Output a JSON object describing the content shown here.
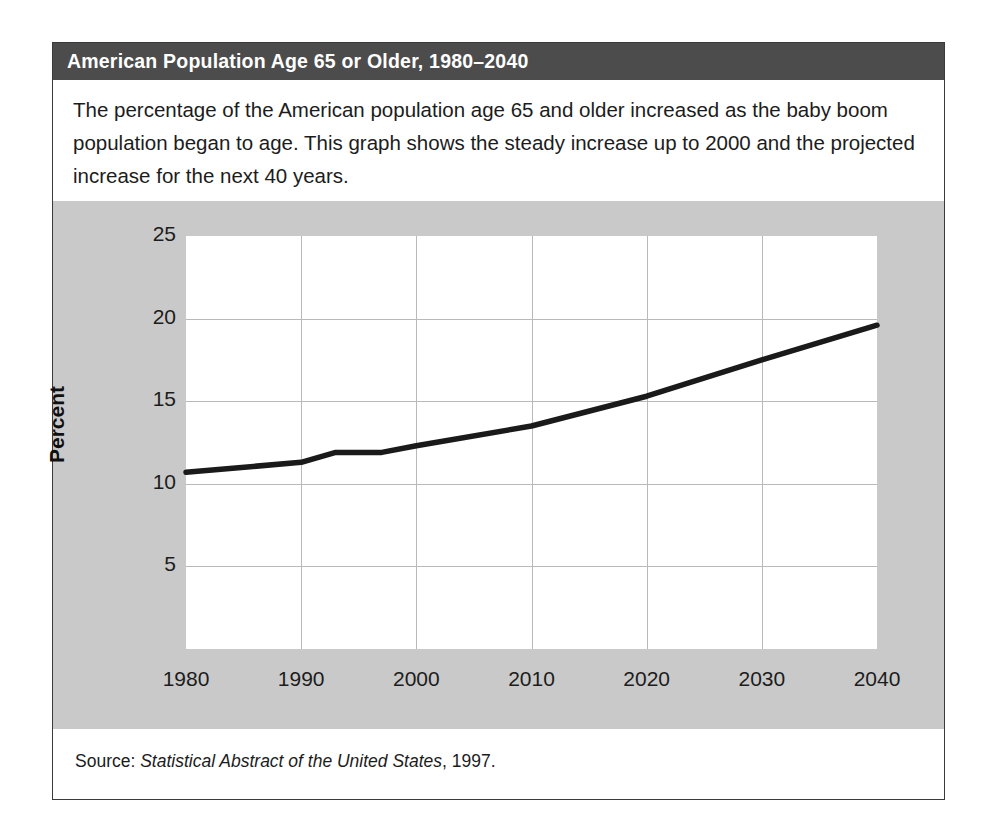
{
  "figure": {
    "title": "American Population Age 65 or Older, 1980–2040",
    "description": "The percentage of the American population age 65 and older increased as the baby boom population began to age. This graph shows the steady increase up to 2000 and the projected increase for the next 40 years.",
    "source_prefix": "Source: ",
    "source_title": "Statistical Abstract of the United States",
    "source_suffix": ", 1997.",
    "colors": {
      "title_bar": "#4c4c4c",
      "title_text": "#ffffff",
      "chart_background": "#c9c9c9",
      "plot_background": "#ffffff",
      "gridline": "#b9b9b9",
      "data_line": "#1a1a1a",
      "panel_border": "#3a3a3a"
    }
  },
  "chart_data": {
    "type": "line",
    "title": "American Population Age 65 or Older, 1980–2040",
    "xlabel": "",
    "ylabel": "Percent",
    "xlim": [
      1980,
      2040
    ],
    "ylim": [
      0,
      25
    ],
    "xticks": [
      1980,
      1990,
      2000,
      2010,
      2020,
      2030,
      2040
    ],
    "yticks": [
      5,
      10,
      15,
      20,
      25
    ],
    "grid": true,
    "legend": "none",
    "series": [
      {
        "name": "Percent of population age 65 or older",
        "x": [
          1980,
          1990,
          1993,
          1997,
          2000,
          2010,
          2020,
          2030,
          2040
        ],
        "values": [
          10.7,
          11.3,
          11.9,
          11.9,
          12.3,
          13.5,
          15.3,
          17.5,
          19.6
        ]
      }
    ]
  }
}
